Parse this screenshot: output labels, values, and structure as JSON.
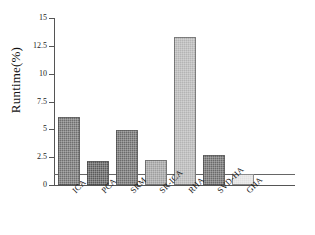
{
  "chart_data": {
    "type": "bar",
    "title": "",
    "xlabel": "",
    "ylabel": "Runtime(%)",
    "categories": [
      "ICA",
      "PCA",
      "SRM",
      "SR-ICA",
      "RHA",
      "SVD-HA",
      "GHA"
    ],
    "values": [
      6.1,
      2.2,
      4.95,
      2.25,
      13.3,
      2.7,
      0.95
    ],
    "ylim": [
      0,
      15
    ],
    "yticks": [
      0,
      2.5,
      5,
      7.5,
      10,
      12.5,
      15
    ],
    "ytick_labels": [
      "0",
      "2.5",
      "5",
      "7.5",
      "10",
      "12.5",
      "15"
    ],
    "grid": false,
    "legend": "none",
    "annotations": [
      {
        "type": "hline",
        "value": 1.0,
        "label": ""
      }
    ],
    "bar_colors": [
      "#6f6f6f",
      "#5a5a5a",
      "#6b6b6b",
      "#9e9e9e",
      "#b4b4b4",
      "#6a6a6a",
      "#e0e0e0"
    ]
  },
  "axis": {
    "y_title": "Runtime(%)"
  }
}
